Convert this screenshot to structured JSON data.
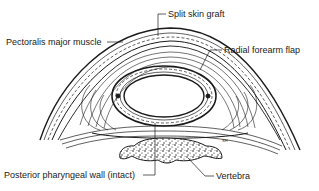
{
  "figure": {
    "type": "anatomical cross-section diagram",
    "colors": {
      "ink": "#1a1a1a",
      "background": "#ffffff"
    },
    "artist_signature": "SH",
    "labels": [
      {
        "id": "split-skin-graft",
        "text": "Split skin graft"
      },
      {
        "id": "pectoralis-major-muscle",
        "text": "Pectoralis major muscle"
      },
      {
        "id": "radial-forearm-flap",
        "text": "Radial forearm flap"
      },
      {
        "id": "posterior-pharyngeal-wall",
        "text": "Posterior pharyngeal wall (intact)"
      },
      {
        "id": "vertebra",
        "text": "Vertebra"
      }
    ]
  }
}
